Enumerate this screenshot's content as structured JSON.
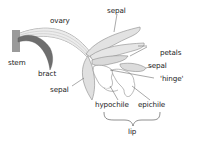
{
  "labels": {
    "ovary": "ovary",
    "sepal_top": "sepal",
    "petals": "petals",
    "sepal_right": "sepal",
    "hinge": "'hinge'",
    "stem": "stem",
    "bract": "bract",
    "sepal_left": "sepal",
    "hypochile": "hypochile",
    "epichile": "epichile",
    "lip": "lip"
  },
  "colors": {
    "stem": "#9a9a9a",
    "bract": "#6e6e6e",
    "ovary_fill": "#dcdcdc",
    "petal_fill": "#e2e2e2",
    "outline": "#8a8a8a",
    "leader_line": "#555555",
    "text": "#222222"
  }
}
